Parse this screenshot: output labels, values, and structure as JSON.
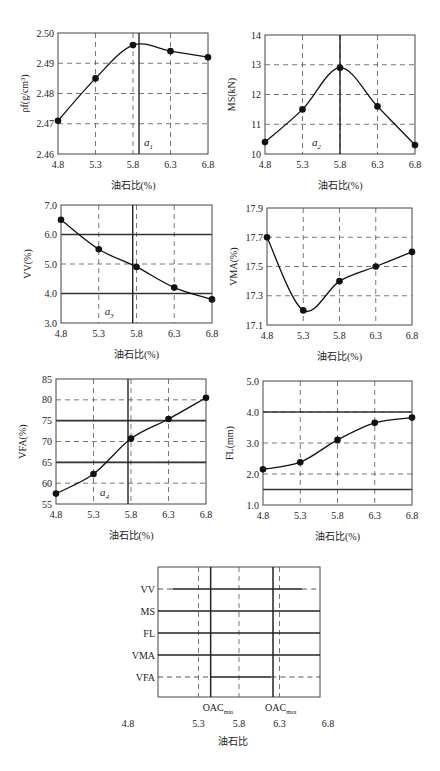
{
  "chart_data": [
    {
      "id": "density",
      "type": "line",
      "title": "",
      "xlabel": "油石比(%)",
      "ylabel": "ρf(g/cm³)",
      "x": [
        4.8,
        5.3,
        5.8,
        6.3,
        6.8
      ],
      "values": [
        2.471,
        2.485,
        2.496,
        2.494,
        2.492
      ],
      "xlim": [
        4.8,
        6.8
      ],
      "ylim": [
        2.46,
        2.5
      ],
      "yticks": [
        "2.46",
        "2.47",
        "2.48",
        "2.49",
        "2.50"
      ],
      "xticks": [
        "4.8",
        "5.3",
        "5.8",
        "6.3",
        "6.8"
      ],
      "grid": "dashed",
      "marker_line": {
        "x": 5.88,
        "label": "a1"
      },
      "limit_lines": []
    },
    {
      "id": "stability",
      "type": "line",
      "title": "",
      "xlabel": "油石比(%)",
      "ylabel": "MS(kN)",
      "x": [
        4.8,
        5.3,
        5.8,
        6.3,
        6.8
      ],
      "values": [
        10.4,
        11.5,
        12.9,
        11.6,
        10.3
      ],
      "xlim": [
        4.8,
        6.8
      ],
      "ylim": [
        10,
        14
      ],
      "yticks": [
        "10",
        "11",
        "12",
        "13",
        "14"
      ],
      "xticks": [
        "4.8",
        "5.3",
        "5.8",
        "6.3",
        "6.8"
      ],
      "grid": "dashed",
      "marker_line": {
        "x": 5.8,
        "label": "a2"
      },
      "limit_lines": []
    },
    {
      "id": "vv",
      "type": "line",
      "title": "",
      "xlabel": "油石比(%)",
      "ylabel": "VV(%)",
      "x": [
        4.8,
        5.3,
        5.8,
        6.3,
        6.8
      ],
      "values": [
        6.5,
        5.5,
        4.9,
        4.2,
        3.8
      ],
      "xlim": [
        4.8,
        6.8
      ],
      "ylim": [
        3.0,
        7.0
      ],
      "yticks": [
        "3.0",
        "4.0",
        "5.0",
        "6.0",
        "7.0"
      ],
      "xticks": [
        "4.8",
        "5.3",
        "5.8",
        "6.3",
        "6.8"
      ],
      "grid": "dashed",
      "marker_line": {
        "x": 5.75,
        "label": "a3"
      },
      "limit_lines": [
        4.0,
        6.0
      ]
    },
    {
      "id": "vma",
      "type": "line",
      "title": "",
      "xlabel": "油石比(%)",
      "ylabel": "VMA(%)",
      "x": [
        4.8,
        5.3,
        5.8,
        6.3,
        6.8
      ],
      "values": [
        17.7,
        17.2,
        17.4,
        17.5,
        17.6
      ],
      "xlim": [
        4.8,
        6.8
      ],
      "ylim": [
        17.1,
        17.9
      ],
      "yticks": [
        "17.1",
        "17.3",
        "17.5",
        "17.7",
        "17.9"
      ],
      "xticks": [
        "4.8",
        "5.3",
        "5.8",
        "6.3",
        "6.8"
      ],
      "grid": "dashed",
      "marker_line": null,
      "limit_lines": []
    },
    {
      "id": "vfa",
      "type": "line",
      "title": "",
      "xlabel": "油石比(%)",
      "ylabel": "VFA(%)",
      "x": [
        4.8,
        5.3,
        5.8,
        6.3,
        6.8
      ],
      "values": [
        57.5,
        62.2,
        70.7,
        75.4,
        80.5
      ],
      "xlim": [
        4.8,
        6.8
      ],
      "ylim": [
        55,
        85
      ],
      "yticks": [
        "55",
        "60",
        "65",
        "70",
        "75",
        "80",
        "85"
      ],
      "xticks": [
        "4.8",
        "5.3",
        "5.8",
        "6.3",
        "6.8"
      ],
      "grid": "dashed",
      "marker_line": {
        "x": 5.76,
        "label": "a4"
      },
      "limit_lines": [
        65,
        75
      ]
    },
    {
      "id": "flow",
      "type": "line",
      "title": "",
      "xlabel": "油石比(%)",
      "ylabel": "FL(mm)",
      "x": [
        4.8,
        5.3,
        5.8,
        6.3,
        6.8
      ],
      "values": [
        2.15,
        2.38,
        3.1,
        3.65,
        3.82
      ],
      "xlim": [
        4.8,
        6.8
      ],
      "ylim": [
        1.0,
        5.0
      ],
      "yticks": [
        "1.0",
        "2.0",
        "3.0",
        "4.0",
        "5.0"
      ],
      "xticks": [
        "4.8",
        "5.3",
        "5.8",
        "6.3",
        "6.8"
      ],
      "grid": "dashed",
      "marker_line": null,
      "limit_lines": [
        1.5,
        4.0
      ]
    },
    {
      "id": "summary",
      "type": "range",
      "xlabel": "油石比",
      "xlim": [
        4.8,
        6.8
      ],
      "xticks": [
        "4.8",
        "5.3",
        "5.8",
        "6.3",
        "6.8"
      ],
      "rows": [
        {
          "label": "VV",
          "solid": [
            4.98,
            6.58
          ],
          "dashed": [
            [
              4.8,
              4.98
            ],
            [
              6.58,
              6.8
            ]
          ]
        },
        {
          "label": "MS",
          "solid": [
            4.8,
            6.8
          ],
          "dashed": []
        },
        {
          "label": "FL",
          "solid": [
            4.8,
            6.8
          ],
          "dashed": []
        },
        {
          "label": "VMA",
          "solid": [
            4.8,
            6.8
          ],
          "dashed": []
        },
        {
          "label": "VFA",
          "solid": [
            5.45,
            6.2
          ],
          "dashed": [
            [
              4.8,
              5.45
            ],
            [
              6.2,
              6.8
            ]
          ]
        }
      ],
      "oac_min": {
        "x": 5.45,
        "label": "OAC",
        "sub": "min"
      },
      "oac_max": {
        "x": 6.22,
        "label": "OAC",
        "sub": "max"
      },
      "guide_lines": [
        5.3,
        5.8,
        6.3
      ]
    }
  ]
}
